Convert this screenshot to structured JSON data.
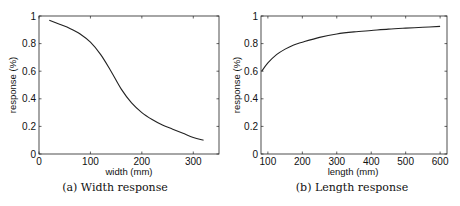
{
  "chart_data": [
    {
      "type": "line",
      "caption": "(a) Width response",
      "xlabel": "width (mm)",
      "ylabel": "response (%)",
      "xlim": [
        0,
        350
      ],
      "ylim": [
        0,
        1
      ],
      "xticks": [
        0,
        100,
        200,
        300
      ],
      "yticks": [
        0,
        0.2,
        0.4,
        0.6,
        0.8,
        1
      ],
      "ytick_labels": [
        "0",
        "0.2",
        "0.4",
        "0.6",
        "0.8",
        "1"
      ],
      "grid": false,
      "legend": null,
      "series": [
        {
          "name": "width response",
          "x": [
            20,
            40,
            60,
            80,
            100,
            120,
            140,
            160,
            180,
            200,
            220,
            240,
            260,
            280,
            300,
            320
          ],
          "y": [
            0.97,
            0.94,
            0.91,
            0.87,
            0.81,
            0.72,
            0.6,
            0.47,
            0.37,
            0.3,
            0.25,
            0.21,
            0.18,
            0.15,
            0.12,
            0.1
          ]
        }
      ]
    },
    {
      "type": "line",
      "caption": "(b) Length response",
      "xlabel": "length (mm)",
      "ylabel": "response (%)",
      "xlim": [
        80,
        620
      ],
      "ylim": [
        0,
        1
      ],
      "xticks": [
        100,
        200,
        300,
        400,
        500,
        600
      ],
      "yticks": [
        0,
        0.2,
        0.4,
        0.6,
        0.8,
        1
      ],
      "ytick_labels": [
        "0",
        "0.2",
        "0.4",
        "0.6",
        "0.8",
        "1"
      ],
      "grid": false,
      "legend": null,
      "series": [
        {
          "name": "length response",
          "x": [
            82,
            100,
            125,
            150,
            175,
            200,
            250,
            300,
            350,
            400,
            450,
            500,
            550,
            600
          ],
          "y": [
            0.6,
            0.66,
            0.72,
            0.76,
            0.79,
            0.81,
            0.845,
            0.87,
            0.885,
            0.895,
            0.905,
            0.912,
            0.918,
            0.925
          ]
        }
      ]
    }
  ]
}
